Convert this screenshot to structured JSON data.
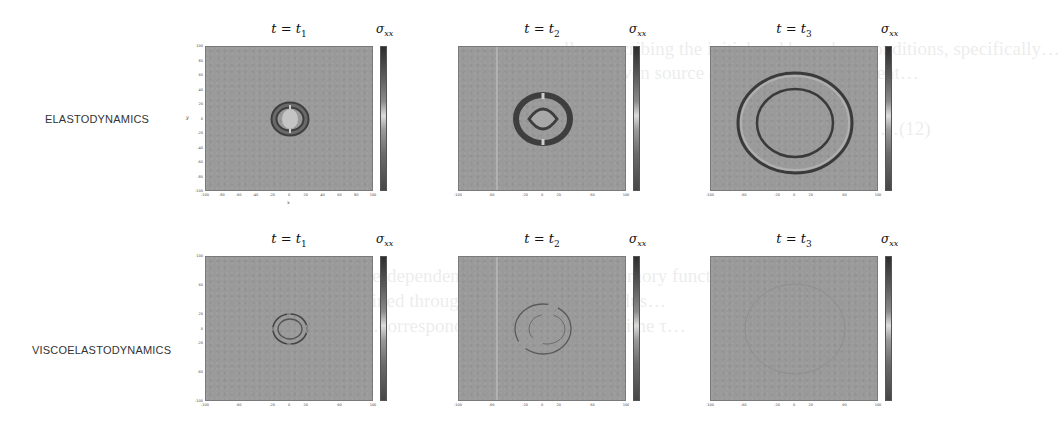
{
  "figure": {
    "rows": [
      {
        "label": "ELASTODYNAMICS",
        "panels": [
          {
            "title_var": "t = t",
            "title_sub": "1",
            "colorbar_var": "σ",
            "colorbar_sub": "xx",
            "wave": "elastic-small"
          },
          {
            "title_var": "t = t",
            "title_sub": "2",
            "colorbar_var": "σ",
            "colorbar_sub": "xx",
            "wave": "elastic-medium"
          },
          {
            "title_var": "t = t",
            "title_sub": "3",
            "colorbar_var": "σ",
            "colorbar_sub": "xx",
            "wave": "elastic-large"
          }
        ]
      },
      {
        "label": "VISCOELASTODYNAMICS",
        "panels": [
          {
            "title_var": "t = t",
            "title_sub": "1",
            "colorbar_var": "σ",
            "colorbar_sub": "xx",
            "wave": "visco-small"
          },
          {
            "title_var": "t = t",
            "title_sub": "2",
            "colorbar_var": "σ",
            "colorbar_sub": "xx",
            "wave": "visco-medium-faint"
          },
          {
            "title_var": "t = t",
            "title_sub": "3",
            "colorbar_var": "σ",
            "colorbar_sub": "xx",
            "wave": "visco-dissipated"
          }
        ]
      }
    ],
    "axes": {
      "x_label": "x",
      "y_label": "y",
      "x_ticks": [
        "-100",
        "-80",
        "-60",
        "-40",
        "-20",
        "0",
        "20",
        "40",
        "60",
        "80",
        "100"
      ],
      "y_ticks": [
        "100",
        "80",
        "60",
        "40",
        "20",
        "0",
        "-20",
        "-40",
        "-60",
        "-80",
        "-100"
      ],
      "xlim": [
        -100,
        100
      ],
      "ylim": [
        -100,
        100
      ]
    },
    "colorbar_ticks": [
      "5",
      "4",
      "3",
      "2",
      "1",
      "0",
      "-1",
      "-2",
      "-3",
      "-4",
      "-5"
    ],
    "colors": {
      "field_background": "#9a9a9a",
      "wavefront_dark": "#3a3a3a",
      "wavefront_light": "#c8c8c8"
    }
  },
  "background_text": [
    "…lly prescribing the initial and boundary conditions, specifically…",
    "…of the given source and solution independent…",
    "…(12)",
    "…the time-dependent kernel K(t) is the memory function…",
    "…obtained through the relaxation modulus…",
    "…corresponding to the relaxation time τ…"
  ]
}
